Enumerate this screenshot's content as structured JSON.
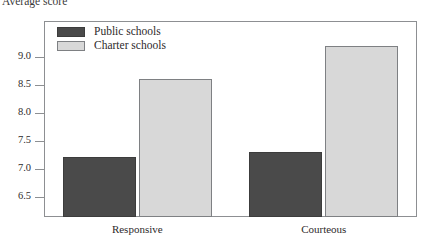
{
  "chart_data": {
    "type": "bar",
    "title": "",
    "xlabel": "",
    "ylabel": "Average score",
    "categories": [
      "Responsive",
      "Courteous"
    ],
    "series": [
      {
        "name": "Public schools",
        "color": "#4a4a4a",
        "values": [
          7.22,
          7.3
        ]
      },
      {
        "name": "Charter schools",
        "color": "#d8d8d8",
        "values": [
          8.61,
          9.19
        ]
      }
    ],
    "ylim": [
      6.14,
      9.64
    ],
    "yticks": [
      6.5,
      7.0,
      7.5,
      8.0,
      8.5,
      9.0
    ],
    "ytick_labels": [
      "6.5",
      "7.0",
      "7.5",
      "8.0",
      "8.5",
      "9.0"
    ],
    "grid": false,
    "legend_position": "top-left-inside",
    "frame": true
  },
  "legend": {
    "entries": [
      {
        "label": "Public schools",
        "swatch": "public"
      },
      {
        "label": "Charter schools",
        "swatch": "charter"
      }
    ]
  }
}
